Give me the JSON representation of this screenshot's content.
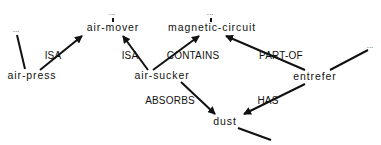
{
  "diagram": {
    "type": "semantic-network",
    "nodes": [
      {
        "id": "air-mover",
        "label": "air-mover",
        "x": 113,
        "y": 30
      },
      {
        "id": "magnetic-circuit",
        "label": "magnetic-circuit",
        "x": 212,
        "y": 30
      },
      {
        "id": "air-press",
        "label": "air-press",
        "x": 32,
        "y": 78
      },
      {
        "id": "air-sucker",
        "label": "air-sucker",
        "x": 162,
        "y": 78
      },
      {
        "id": "entrefer",
        "label": "entrefer",
        "x": 315,
        "y": 79
      },
      {
        "id": "dust",
        "label": "dust",
        "x": 225,
        "y": 124
      },
      {
        "id": "ellipsis-air-mover",
        "label": "...",
        "x": 112,
        "y": 15
      },
      {
        "id": "ellipsis-magnetic-circuit",
        "label": "...",
        "x": 208,
        "y": 15
      },
      {
        "id": "ellipsis-left",
        "label": "...",
        "x": 16,
        "y": 32
      },
      {
        "id": "ellipsis-right",
        "label": "...",
        "x": 370,
        "y": 48
      }
    ],
    "edges": [
      {
        "from": "air-press",
        "to": "air-mover",
        "label": "ISA",
        "label_x": 53,
        "label_y": 58,
        "arrow": true
      },
      {
        "from": "air-sucker",
        "to": "air-mover",
        "label": "ISA",
        "label_x": 130,
        "label_y": 58,
        "arrow": true
      },
      {
        "from": "air-sucker",
        "to": "magnetic-circuit",
        "label": "CONTAINS",
        "label_x": 193,
        "label_y": 58,
        "arrow": true
      },
      {
        "from": "entrefer",
        "to": "magnetic-circuit",
        "label": "PART-OF",
        "label_x": 280,
        "label_y": 58,
        "arrow": true
      },
      {
        "from": "air-sucker",
        "to": "dust",
        "label": "ABSORBS",
        "label_x": 170,
        "label_y": 103,
        "arrow": true
      },
      {
        "from": "entrefer",
        "to": "dust",
        "label": "HAS",
        "label_x": 268,
        "label_y": 103,
        "arrow": true
      }
    ],
    "stubs": [
      {
        "between": "ellipsis-air-mover",
        "x1": 113,
        "y1": 18,
        "x2": 113,
        "y2": 22
      },
      {
        "between": "ellipsis-magnetic-circuit",
        "x1": 211,
        "y1": 18,
        "x2": 211,
        "y2": 22
      },
      {
        "between": "ellipsis-left",
        "x1": 17,
        "y1": 35,
        "x2": 25,
        "y2": 69
      },
      {
        "between": "ellipsis-right",
        "x1": 368,
        "y1": 50,
        "x2": 330,
        "y2": 70
      },
      {
        "between": "dust-outgoing",
        "x1": 238,
        "y1": 128,
        "x2": 271,
        "y2": 140
      }
    ]
  }
}
